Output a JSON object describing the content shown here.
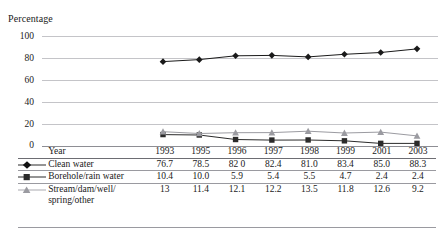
{
  "figure": {
    "cutoff_title_fragment": "",
    "y_axis_title": "Percentage"
  },
  "chart_data": {
    "type": "line",
    "title": "",
    "xlabel": "Year",
    "ylabel": "Percentage",
    "ylim": [
      0,
      100
    ],
    "yticks": [
      0,
      20,
      40,
      60,
      80,
      100
    ],
    "grid": true,
    "legend": "table",
    "categories": [
      "1993",
      "1995",
      "1996",
      "1997",
      "1998",
      "1999",
      "2001",
      "2003"
    ],
    "series": [
      {
        "name": "Clean water",
        "marker": "diamond",
        "color": "#1a1a1a",
        "values": [
          76.7,
          78.5,
          82.0,
          82.4,
          81.0,
          83.4,
          85.0,
          88.3
        ],
        "labels": [
          "76.7",
          "78.5",
          "82 0",
          "82.4",
          "81.0",
          "83.4",
          "85.0",
          "88.3"
        ]
      },
      {
        "name": "Borehole/rain water",
        "marker": "square",
        "color": "#2b2b2b",
        "values": [
          10.4,
          10.0,
          5.9,
          5.4,
          5.5,
          4.7,
          2.4,
          2.4
        ],
        "labels": [
          "10.4",
          "10.0",
          "5.9",
          "5.4",
          "5.5",
          "4.7",
          "2.4",
          "2.4"
        ]
      },
      {
        "name": "Stream/dam/well/spring/other",
        "marker": "triangle",
        "color": "#9b9ba1",
        "values": [
          13,
          11.4,
          12.1,
          12.2,
          13.5,
          11.8,
          12.6,
          9.2
        ],
        "labels": [
          "13",
          "11.4",
          "12.1",
          "12.2",
          "13.5",
          "11.8",
          "12.6",
          "9.2"
        ]
      }
    ]
  },
  "table": {
    "year_header": "Year",
    "columns": [
      "1993",
      "1995",
      "1996",
      "1997",
      "1998",
      "1999",
      "2001",
      "2003"
    ],
    "rows": [
      {
        "label": "Clean water",
        "label_line1": "Clean water",
        "label_line2": "",
        "marker": "diamond",
        "values": [
          "76.7",
          "78.5",
          "82 0",
          "82.4",
          "81.0",
          "83.4",
          "85.0",
          "88.3"
        ]
      },
      {
        "label": "Borehole/rain water",
        "label_line1": "Borehole/rain water",
        "label_line2": "",
        "marker": "square",
        "values": [
          "10.4",
          "10.0",
          "5.9",
          "5.4",
          "5.5",
          "4.7",
          "2.4",
          "2.4"
        ]
      },
      {
        "label": "Stream/dam/well/spring/other",
        "label_line1": "Stream/dam/well/",
        "label_line2": "spring/other",
        "marker": "triangle",
        "values": [
          "13",
          "11.4",
          "12.1",
          "12.2",
          "13.5",
          "11.8",
          "12.6",
          "9.2"
        ]
      }
    ]
  }
}
